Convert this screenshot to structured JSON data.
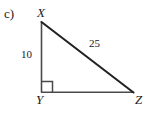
{
  "figure": {
    "part_label": "c)",
    "background_color": "#ffffff",
    "stroke_color": "#3a3a3a",
    "hypotenuse_color": "#222222",
    "text_color": "#1a1a1a",
    "width": 149,
    "height": 115
  },
  "vertices": [
    {
      "name": "X",
      "label": "X",
      "x": 41,
      "y": 22
    },
    {
      "name": "Y",
      "label": "Y",
      "x": 41,
      "y": 92
    },
    {
      "name": "Z",
      "label": "Z",
      "x": 133,
      "y": 92
    }
  ],
  "sides": [
    {
      "name": "XY",
      "label": "10",
      "type": "leg",
      "orientation": "vertical"
    },
    {
      "name": "XZ",
      "label": "25",
      "type": "hypotenuse",
      "orientation": "diagonal"
    },
    {
      "name": "YZ",
      "label": "",
      "type": "leg",
      "orientation": "horizontal"
    }
  ],
  "angles": [
    {
      "at": "Y",
      "type": "right-angle",
      "marker": "square",
      "size": 11
    }
  ]
}
